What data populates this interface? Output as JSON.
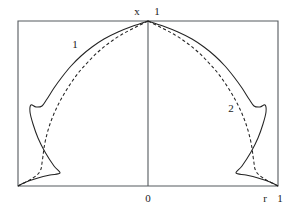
{
  "figure": {
    "type": "line-plot",
    "background": "#ffffff",
    "line_color": "#232323",
    "frame_color": "#555a5e",
    "frame": {
      "left": 18,
      "top": 21,
      "right": 278,
      "bottom": 186
    },
    "center_x": 148
  },
  "labels": {
    "top_axis_name": "x",
    "top_axis_value": "1",
    "bottom_center_value": "0",
    "bottom_axis_name": "r",
    "bottom_axis_value": "1",
    "curve_one": "1",
    "curve_two": "2"
  },
  "label_positions": {
    "top_axis_name": {
      "x": 137,
      "y": 15
    },
    "top_axis_value": {
      "x": 157,
      "y": 15
    },
    "bottom_center_value": {
      "x": 148,
      "y": 202
    },
    "bottom_axis_name": {
      "x": 265,
      "y": 202
    },
    "bottom_axis_value": {
      "x": 280,
      "y": 202
    },
    "curve_one": {
      "x": 75,
      "y": 48
    },
    "curve_two": {
      "x": 231,
      "y": 112
    }
  },
  "chart_data": {
    "type": "line",
    "title": "",
    "xlabel": "r",
    "ylabel": "x",
    "xlim": [
      -1,
      1
    ],
    "ylim": [
      0,
      1
    ],
    "grid": false,
    "legend": "inline-labels",
    "axes": {
      "vertical_axis_label": "x",
      "vertical_axis_max_tick": "1",
      "origin_tick": "0",
      "horizontal_axis_label": "r",
      "horizontal_axis_max_tick": "1"
    },
    "series": [
      {
        "name": "1",
        "style": "solid",
        "label_position": {
          "x": 75,
          "y": 48
        },
        "description": "Solid profile curve, symmetric about r=0, peaking at x=1 on the axis, with a sharp re-entrant hook near the wall",
        "points_left_px": [
          [
            148,
            21
          ],
          [
            133,
            26
          ],
          [
            118,
            32
          ],
          [
            104,
            39
          ],
          [
            92,
            47
          ],
          [
            81,
            56
          ],
          [
            71,
            66
          ],
          [
            62,
            77
          ],
          [
            54,
            88
          ],
          [
            47,
            99
          ],
          [
            42,
            106
          ],
          [
            36,
            107
          ],
          [
            31,
            105
          ],
          [
            30,
            112
          ],
          [
            33,
            124
          ],
          [
            38,
            138
          ],
          [
            45,
            152
          ],
          [
            54,
            166
          ],
          [
            60,
            173
          ],
          [
            50,
            175
          ],
          [
            38,
            178
          ],
          [
            26,
            182
          ],
          [
            18,
            186
          ]
        ],
        "points_right_px": [
          [
            148,
            21
          ],
          [
            163,
            26
          ],
          [
            178,
            32
          ],
          [
            192,
            39
          ],
          [
            204,
            47
          ],
          [
            215,
            56
          ],
          [
            225,
            66
          ],
          [
            234,
            77
          ],
          [
            242,
            88
          ],
          [
            249,
            99
          ],
          [
            254,
            106
          ],
          [
            260,
            107
          ],
          [
            265,
            105
          ],
          [
            266,
            112
          ],
          [
            263,
            124
          ],
          [
            258,
            138
          ],
          [
            251,
            152
          ],
          [
            242,
            166
          ],
          [
            236,
            173
          ],
          [
            246,
            175
          ],
          [
            258,
            178
          ],
          [
            270,
            182
          ],
          [
            278,
            186
          ]
        ]
      },
      {
        "name": "2",
        "style": "dashed",
        "label_position": {
          "x": 231,
          "y": 112
        },
        "description": "Dashed profile curve lying just inside the solid curve, smoother near the wall with a steep monotone descent",
        "points_left_px": [
          [
            148,
            21
          ],
          [
            134,
            28
          ],
          [
            121,
            35
          ],
          [
            109,
            43
          ],
          [
            98,
            52
          ],
          [
            88,
            62
          ],
          [
            79,
            72
          ],
          [
            71,
            83
          ],
          [
            64,
            94
          ],
          [
            58,
            105
          ],
          [
            53,
            116
          ],
          [
            49,
            127
          ],
          [
            46,
            138
          ],
          [
            44,
            148
          ],
          [
            43,
            156
          ],
          [
            42,
            163
          ],
          [
            41,
            169
          ],
          [
            38,
            174
          ],
          [
            33,
            178
          ],
          [
            26,
            182
          ],
          [
            18,
            186
          ]
        ],
        "points_right_px": [
          [
            148,
            21
          ],
          [
            162,
            28
          ],
          [
            175,
            35
          ],
          [
            187,
            43
          ],
          [
            198,
            52
          ],
          [
            208,
            62
          ],
          [
            217,
            72
          ],
          [
            225,
            83
          ],
          [
            232,
            94
          ],
          [
            238,
            105
          ],
          [
            243,
            116
          ],
          [
            247,
            127
          ],
          [
            250,
            138
          ],
          [
            252,
            148
          ],
          [
            253,
            156
          ],
          [
            254,
            163
          ],
          [
            255,
            169
          ],
          [
            258,
            174
          ],
          [
            263,
            178
          ],
          [
            270,
            182
          ],
          [
            278,
            186
          ]
        ]
      }
    ]
  }
}
